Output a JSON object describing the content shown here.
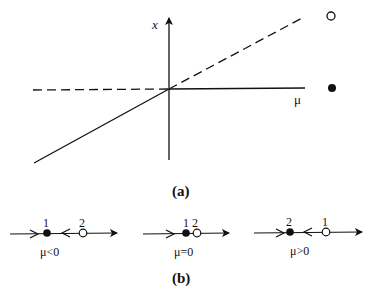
{
  "figure": {
    "panel_a": {
      "caption": "(a)",
      "vertical_axis_label": "x",
      "horizontal_axis_label": "μ",
      "branches": [
        {
          "name": "x=0 for μ<0",
          "style": "dashed",
          "stability": "unstable"
        },
        {
          "name": "x=0 for μ>0",
          "style": "solid",
          "stability": "stable"
        },
        {
          "name": "x=μ for μ<0",
          "style": "solid",
          "stability": "stable"
        },
        {
          "name": "x=μ for μ>0",
          "style": "dashed",
          "stability": "unstable"
        }
      ],
      "legend": [
        {
          "marker": "open-circle",
          "meaning": "unstable"
        },
        {
          "marker": "filled-circle",
          "meaning": "stable"
        }
      ]
    },
    "panel_b": {
      "caption": "(b)",
      "phase_lines": [
        {
          "condition": "μ<0",
          "points": [
            {
              "label": "1",
              "type": "filled"
            },
            {
              "label": "2",
              "type": "open"
            }
          ]
        },
        {
          "condition": "μ=0",
          "points": [
            {
              "label": "1",
              "type": "filled"
            },
            {
              "label": "2",
              "type": "open"
            }
          ],
          "combined_label": "1 2"
        },
        {
          "condition": "μ>0",
          "points": [
            {
              "label": "2",
              "type": "filled"
            },
            {
              "label": "1",
              "type": "open"
            }
          ]
        }
      ]
    },
    "colors": {
      "ink": "#111111",
      "background": "#ffffff"
    }
  }
}
